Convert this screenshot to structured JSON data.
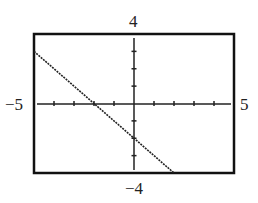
{
  "chart_data": {
    "type": "line",
    "title": "",
    "xlabel": "",
    "ylabel": "",
    "xlim": [
      -5,
      5
    ],
    "ylim": [
      -4,
      4
    ],
    "xscale": 1,
    "yscale": 1,
    "grid": false,
    "window_labels": {
      "xmin": "−5",
      "xmax": "5",
      "ymin": "−4",
      "ymax": "4"
    },
    "series": [
      {
        "name": "y = -x - 2",
        "x": [
          -5,
          -2,
          0,
          2
        ],
        "y": [
          3,
          0,
          -2,
          -4
        ]
      }
    ]
  }
}
